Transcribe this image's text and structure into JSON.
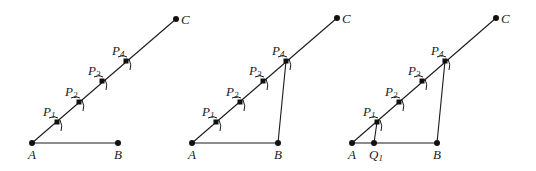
{
  "figures": [
    {
      "id": "fig1",
      "A": {
        "label": "A",
        "x": 32,
        "y": 143
      },
      "B": {
        "label": "B",
        "x": 118,
        "y": 143
      },
      "C": {
        "label": "C",
        "x": 176,
        "y": 19
      },
      "P": [
        {
          "label": "P",
          "sub": "1",
          "x": 57,
          "y": 122
        },
        {
          "label": "P",
          "sub": "2",
          "x": 79,
          "y": 102
        },
        {
          "label": "P",
          "sub": "3",
          "x": 102,
          "y": 81
        },
        {
          "label": "P",
          "sub": "4",
          "x": 126,
          "y": 61
        }
      ],
      "segments": [
        [
          "A",
          "B"
        ],
        [
          "A",
          "C"
        ]
      ]
    },
    {
      "id": "fig2",
      "A": {
        "label": "A",
        "x": 192,
        "y": 143
      },
      "B": {
        "label": "B",
        "x": 278,
        "y": 143
      },
      "C": {
        "label": "C",
        "x": 337,
        "y": 18
      },
      "P": [
        {
          "label": "P",
          "sub": "1",
          "x": 216,
          "y": 122
        },
        {
          "label": "P",
          "sub": "2",
          "x": 240,
          "y": 102
        },
        {
          "label": "P",
          "sub": "3",
          "x": 263,
          "y": 81
        },
        {
          "label": "P",
          "sub": "4",
          "x": 286,
          "y": 61
        }
      ],
      "segments": [
        [
          "A",
          "B"
        ],
        [
          "A",
          "C"
        ],
        [
          "P4",
          "B"
        ]
      ]
    },
    {
      "id": "fig3",
      "A": {
        "label": "A",
        "x": 352,
        "y": 143
      },
      "B": {
        "label": "B",
        "x": 437,
        "y": 143
      },
      "C": {
        "label": "C",
        "x": 496,
        "y": 18
      },
      "Q": {
        "label": "Q",
        "sub": "1",
        "x": 374,
        "y": 143
      },
      "P": [
        {
          "label": "P",
          "sub": "1",
          "x": 377,
          "y": 122
        },
        {
          "label": "P",
          "sub": "2",
          "x": 399,
          "y": 102
        },
        {
          "label": "P",
          "sub": "3",
          "x": 422,
          "y": 81
        },
        {
          "label": "P",
          "sub": "4",
          "x": 445,
          "y": 61
        }
      ],
      "segments": [
        [
          "A",
          "B"
        ],
        [
          "A",
          "C"
        ],
        [
          "P4",
          "B"
        ],
        [
          "P1",
          "Q1"
        ]
      ]
    }
  ]
}
